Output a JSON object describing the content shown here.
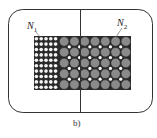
{
  "diagram": {
    "type": "transformer-winding-cross-section",
    "labels": {
      "n1": {
        "base": "N",
        "sub": "1"
      },
      "n2": {
        "base": "N",
        "sub": "2"
      }
    },
    "caption": "b)",
    "winding_n1": {
      "columns": 5,
      "rows": 10,
      "conductor": "small-white-circles"
    },
    "winding_n2": {
      "columns": 7,
      "rows": 5,
      "conductor": "large-gray-circles"
    },
    "colors": {
      "frame": "#333333",
      "winding_fill": "#2a2a2a",
      "n1_conductor": "#f4f4f4",
      "n2_conductor": "#8a8a8a",
      "gap": "#ffffff"
    }
  }
}
